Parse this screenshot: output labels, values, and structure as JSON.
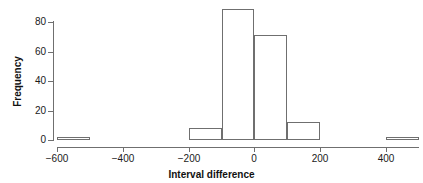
{
  "chart_data": {
    "type": "bar",
    "title": "",
    "subtitle": "",
    "xlabel": "Interval difference",
    "ylabel": "Frequency",
    "xlim": [
      -600,
      500
    ],
    "ylim": [
      0,
      90
    ],
    "grid": false,
    "legend": "none",
    "bin_width": 100,
    "x_ticks": [
      -600,
      -400,
      -200,
      0,
      200,
      400
    ],
    "x_tick_labels": [
      "−600",
      "−400",
      "−200",
      "0",
      "200",
      "400"
    ],
    "y_ticks": [
      0,
      20,
      40,
      60,
      80
    ],
    "y_tick_labels": [
      "0",
      "20",
      "40",
      "60",
      "80"
    ],
    "bins": [
      {
        "x0": -600,
        "x1": -500,
        "value": 2
      },
      {
        "x0": -500,
        "x1": -400,
        "value": 0
      },
      {
        "x0": -400,
        "x1": -300,
        "value": 0
      },
      {
        "x0": -300,
        "x1": -200,
        "value": 0
      },
      {
        "x0": -200,
        "x1": -100,
        "value": 8
      },
      {
        "x0": -100,
        "x1": 0,
        "value": 89
      },
      {
        "x0": 0,
        "x1": 100,
        "value": 71
      },
      {
        "x0": 100,
        "x1": 200,
        "value": 12
      },
      {
        "x0": 200,
        "x1": 300,
        "value": 0
      },
      {
        "x0": 300,
        "x1": 400,
        "value": 0
      },
      {
        "x0": 400,
        "x1": 500,
        "value": 2
      }
    ],
    "categories": [
      "-600..-500",
      "-500..-400",
      "-400..-300",
      "-300..-200",
      "-200..-100",
      "-100..0",
      "0..100",
      "100..200",
      "200..300",
      "300..400",
      "400..500"
    ],
    "values": [
      2,
      0,
      0,
      0,
      8,
      89,
      71,
      12,
      0,
      0,
      2
    ]
  },
  "colors": {
    "bar_stroke": "#6f6f6f",
    "bar_fill": "none",
    "axis": "#6f6f6f",
    "text": "#111111",
    "background": "#ffffff"
  }
}
